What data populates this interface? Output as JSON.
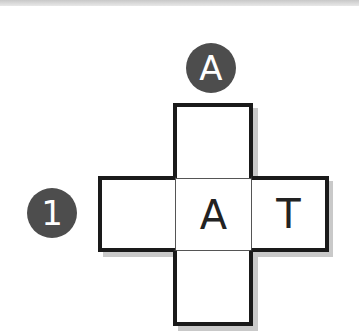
{
  "puzzle": {
    "clues": {
      "down": {
        "number": "A",
        "label": "A"
      },
      "across": {
        "number": "1",
        "label": "1"
      }
    },
    "grid": {
      "top": "",
      "left": "",
      "center": "A",
      "right": "T",
      "bottom": ""
    },
    "colors": {
      "badge": "#4d4d4d",
      "border": "#1a1a1a",
      "shadow": "#c9c9c9"
    }
  }
}
